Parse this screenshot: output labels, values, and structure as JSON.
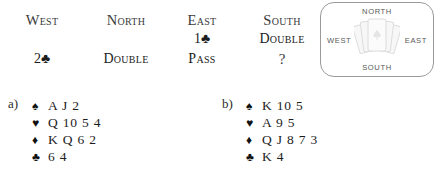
{
  "auction": {
    "headers": [
      {
        "label": "West",
        "seat": "west"
      },
      {
        "label": "North",
        "seat": "north"
      },
      {
        "label": "East",
        "seat": "east"
      },
      {
        "label": "South",
        "seat": "south"
      }
    ],
    "rows": [
      {
        "west": "",
        "north": "",
        "east": "1♣",
        "south": "Double"
      },
      {
        "west": "2♣",
        "north": "Double",
        "east": "Pass",
        "south": "?"
      }
    ]
  },
  "compass": {
    "north": "NORTH",
    "south": "SOUTH",
    "west": "WEST",
    "east": "EAST",
    "cards_icon": "fanned-cards-icon",
    "border_color": "#9a9a9a",
    "label_color": "#5a5a5a"
  },
  "hands": [
    {
      "label": "a)",
      "suits": [
        {
          "symbol": "♠",
          "name": "spade-icon",
          "cards": "A J 2"
        },
        {
          "symbol": "♥",
          "name": "heart-icon",
          "cards": "Q 10 5 4"
        },
        {
          "symbol": "♦",
          "name": "diamond-icon",
          "cards": "K Q 6 2"
        },
        {
          "symbol": "♣",
          "name": "club-icon",
          "cards": "6 4"
        }
      ]
    },
    {
      "label": "b)",
      "suits": [
        {
          "symbol": "♠",
          "name": "spade-icon",
          "cards": "K 10 5"
        },
        {
          "symbol": "♥",
          "name": "heart-icon",
          "cards": "A 9 5"
        },
        {
          "symbol": "♦",
          "name": "diamond-icon",
          "cards": "Q J 8 7 3"
        },
        {
          "symbol": "♣",
          "name": "club-icon",
          "cards": "K 4"
        }
      ]
    }
  ],
  "colors": {
    "text": "#2b2b2b",
    "suit_symbol": "#111111",
    "background": "#ffffff"
  }
}
